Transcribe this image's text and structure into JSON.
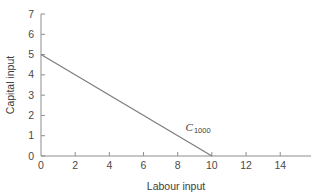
{
  "chart_data": {
    "type": "line",
    "title": "",
    "xlabel": "Labour input",
    "ylabel": "Capital input",
    "xlim": [
      0,
      15.8
    ],
    "ylim": [
      0,
      7
    ],
    "grid": false,
    "legend": null,
    "x_ticks": [
      0,
      2,
      4,
      6,
      8,
      10,
      12,
      14
    ],
    "x_tick_labels": [
      "0",
      "2",
      "4",
      "6",
      "8",
      "10",
      "12",
      "14"
    ],
    "y_ticks": [
      0,
      1,
      2,
      3,
      4,
      5,
      6,
      7
    ],
    "y_tick_labels": [
      "0",
      "1",
      "2",
      "3",
      "4",
      "5",
      "6",
      "7"
    ],
    "series": [
      {
        "name": "C_1000",
        "label_main": "C",
        "label_sub": "1000",
        "x": [
          0,
          10
        ],
        "y": [
          5,
          0
        ],
        "color": "#7a7a7a",
        "annotation": {
          "text_main": "C",
          "text_sub": "1000",
          "x": 8.45,
          "y": 1.25
        }
      }
    ],
    "colors": {
      "axis": "#8d8d8d",
      "line": "#7a7a7a",
      "text": "#3d3d3d",
      "background": "#ffffff"
    }
  }
}
